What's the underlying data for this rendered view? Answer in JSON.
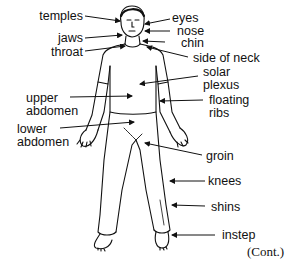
{
  "diagram": {
    "labels": {
      "temples": "temples",
      "jaws": "jaws",
      "throat": "throat",
      "eyes": "eyes",
      "nose": "nose",
      "chin": "chin",
      "side_of_neck": "side of neck",
      "solar_plexus_1": "solar",
      "solar_plexus_2": "plexus",
      "upper_abdomen_1": "upper",
      "upper_abdomen_2": "abdomen",
      "floating_ribs_1": "floating",
      "floating_ribs_2": "ribs",
      "lower_abdomen_1": "lower",
      "lower_abdomen_2": "abdomen",
      "groin": "groin",
      "knees": "knees",
      "shins": "shins",
      "instep": "instep"
    },
    "continuation": "(Cont.)"
  },
  "colors": {
    "ink": "#111111",
    "background": "#ffffff"
  }
}
